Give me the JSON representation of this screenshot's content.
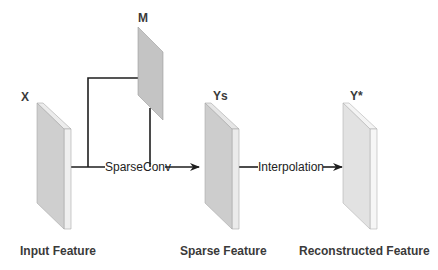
{
  "diagram": {
    "nodes": [
      {
        "id": "input",
        "symbol": "X",
        "caption": "Input Feature",
        "fill": "#cfcfcf",
        "side_fill": "#efefef"
      },
      {
        "id": "mask",
        "symbol": "M",
        "fill": "#c4c4c4"
      },
      {
        "id": "sparse",
        "symbol": "Ys",
        "caption": "Sparse Feature",
        "fill": "#cdcdcd",
        "side_fill": "#ebebeb"
      },
      {
        "id": "recon",
        "symbol": "Y*",
        "caption": "Reconstructed Feature",
        "fill": "#e2e2e2",
        "side_fill": "#f6f6f6"
      }
    ],
    "edges": [
      {
        "from": [
          "input",
          "mask"
        ],
        "to": "sparse",
        "label": "SparseConv"
      },
      {
        "from": "sparse",
        "to": "recon",
        "label": "Interpolation"
      }
    ],
    "colors": {
      "line": "#1e1e1e",
      "text": "#3a3a3a",
      "outline": "#9a9a9a"
    }
  }
}
